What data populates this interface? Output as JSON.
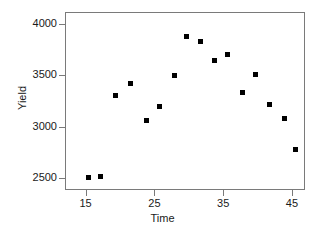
{
  "chart_data": {
    "type": "scatter",
    "title": "",
    "xlabel": "Time",
    "ylabel": "Yield",
    "xlim": [
      12.0,
      46.9
    ],
    "ylim": [
      2380,
      4120
    ],
    "xticks": [
      15,
      25,
      35,
      45
    ],
    "yticks": [
      2500,
      3000,
      3500,
      4000
    ],
    "grid": false,
    "legend": "none",
    "marker": "filled-square",
    "marker_color": "#000000",
    "series": [
      {
        "name": "Yield vs Time",
        "points": [
          {
            "x": 15.4,
            "y": 2505
          },
          {
            "x": 17.2,
            "y": 2515
          },
          {
            "x": 19.3,
            "y": 3300
          },
          {
            "x": 21.5,
            "y": 3420
          },
          {
            "x": 23.8,
            "y": 3060
          },
          {
            "x": 25.8,
            "y": 3200
          },
          {
            "x": 27.9,
            "y": 3500
          },
          {
            "x": 29.7,
            "y": 3880
          },
          {
            "x": 31.7,
            "y": 3830
          },
          {
            "x": 33.7,
            "y": 3650
          },
          {
            "x": 35.7,
            "y": 3700
          },
          {
            "x": 37.8,
            "y": 3330
          },
          {
            "x": 39.7,
            "y": 3510
          },
          {
            "x": 41.8,
            "y": 3220
          },
          {
            "x": 43.9,
            "y": 3080
          },
          {
            "x": 45.5,
            "y": 2780
          }
        ]
      }
    ]
  },
  "axes": {
    "x_label": "Time",
    "y_label": "Yield",
    "x_tick_labels": [
      "15",
      "25",
      "35",
      "45"
    ],
    "y_tick_labels": [
      "2500",
      "3000",
      "3500",
      "4000"
    ]
  },
  "style": {
    "frame_color": "#7a7a7a",
    "point_color": "#000000",
    "text_color": "#1a1a1a",
    "background": "#ffffff"
  }
}
